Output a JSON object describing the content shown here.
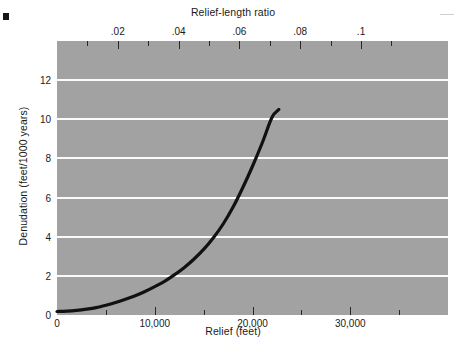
{
  "chart_data": {
    "type": "line",
    "title": "",
    "xlabel": "Relief (feet)",
    "ylabel": "Denudation (feet/1000 years)",
    "x2label": "Relief-length ratio",
    "xlim": [
      0,
      40000
    ],
    "ylim": [
      0,
      14
    ],
    "x2lim": [
      0,
      0.1286
    ],
    "grid": true,
    "legend": null,
    "xticks": [
      0,
      10000,
      20000,
      30000
    ],
    "xticklabels": [
      "0",
      "10,000",
      "20,000",
      "30,000"
    ],
    "xminorticks": [
      5000,
      15000,
      25000,
      35000
    ],
    "yticks": [
      0,
      2,
      4,
      6,
      8,
      10,
      12
    ],
    "yticklabels": [
      "0",
      "2",
      "4",
      "6",
      "8",
      "10",
      "12"
    ],
    "x2ticks": [
      0.02,
      0.04,
      0.06,
      0.08,
      0.1
    ],
    "x2ticklabels": [
      ".02",
      ".04",
      ".06",
      ".08",
      ".1"
    ],
    "x2minorticks": [
      0.01,
      0.03,
      0.05,
      0.07,
      0.09,
      0.11
    ],
    "series": [
      {
        "name": "Denudation rate vs relief",
        "color": "#111111",
        "x": [
          0,
          1000,
          2000,
          3000,
          4000,
          5000,
          6000,
          7000,
          8000,
          9000,
          10000,
          11000,
          12000,
          13000,
          14000,
          15000,
          16000,
          17000,
          18000,
          19000,
          20000,
          21000,
          22000,
          22700
        ],
        "y": [
          0.18,
          0.2,
          0.24,
          0.3,
          0.38,
          0.5,
          0.64,
          0.8,
          0.98,
          1.2,
          1.45,
          1.72,
          2.05,
          2.42,
          2.85,
          3.35,
          3.95,
          4.65,
          5.5,
          6.5,
          7.6,
          8.8,
          10.1,
          10.5
        ]
      }
    ],
    "plot_background": "#a2a2a2",
    "gridline_color": "#fbfbfb",
    "curve_color": "#111111"
  },
  "axes": {
    "top_title": "Relief-length ratio",
    "bottom_title": "Relief (feet)",
    "left_title": "Denudation (feet/1000 years)"
  }
}
